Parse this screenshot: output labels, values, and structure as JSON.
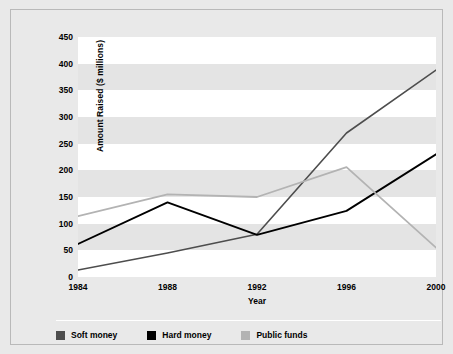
{
  "chart_data": {
    "type": "line",
    "title": "",
    "xlabel": "Year",
    "ylabel": "Amount Raised ($ millions)",
    "x": [
      1984,
      1988,
      1992,
      1996,
      2000
    ],
    "xticklabels": [
      "1984",
      "1988",
      "1992",
      "1996",
      "2000"
    ],
    "yticklabels": [
      "0",
      "50",
      "100",
      "150",
      "200",
      "250",
      "300",
      "350",
      "400",
      "450"
    ],
    "yticks": [
      0,
      50,
      100,
      150,
      200,
      250,
      300,
      350,
      400,
      450
    ],
    "ylim": [
      0,
      450
    ],
    "xlim": [
      1984,
      2000
    ],
    "grid": "horizontal-bands",
    "legend_position": "bottom-left",
    "series": [
      {
        "name": "Soft money",
        "color": "#4d4d4d",
        "values": [
          13,
          45,
          80,
          270,
          388
        ]
      },
      {
        "name": "Hard money",
        "color": "#000000",
        "values": [
          62,
          140,
          79,
          124,
          230
        ]
      },
      {
        "name": "Public funds",
        "color": "#b3b3b3",
        "values": [
          114,
          155,
          150,
          206,
          55
        ]
      }
    ]
  },
  "axis": {
    "y_title": "Amount Raised ($ millions)",
    "x_title": "Year",
    "y_labels": [
      "450",
      "400",
      "350",
      "300",
      "250",
      "200",
      "150",
      "100",
      "50",
      "0"
    ],
    "x_labels": [
      "1984",
      "1988",
      "1992",
      "1996",
      "2000"
    ]
  },
  "legend": {
    "items": [
      {
        "label": "Soft money",
        "color": "#4d4d4d"
      },
      {
        "label": "Hard money",
        "color": "#000000"
      },
      {
        "label": "Public funds",
        "color": "#b3b3b3"
      }
    ]
  },
  "colors": {
    "figure_background": "#e9e9e9",
    "plot_background": "#ffffff",
    "band": "#e4e4e4",
    "frame_border": "#b9b9b9",
    "soft_money": "#4d4d4d",
    "hard_money": "#000000",
    "public_funds": "#b3b3b3"
  }
}
